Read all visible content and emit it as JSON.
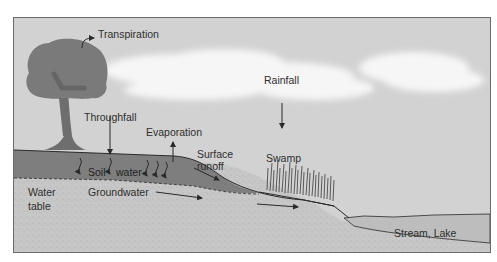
{
  "diagram": {
    "labels": {
      "transpiration": "Transpiration",
      "rainfall": "Rainfall",
      "throughfall": "Throughfall",
      "evaporation": "Evaporation",
      "surface_runoff_1": "Surface",
      "surface_runoff_2": "runoff",
      "swamp": "Swamp",
      "soil": "Soil",
      "water": "water",
      "water_table_1": "Water",
      "water_table_2": "table",
      "groundwater": "Groundwater",
      "stream_lake": "Stream, Lake"
    },
    "colors": {
      "sky": "#d2d2d2",
      "cloud": "#f4f4f4",
      "tree": "#7a7a7a",
      "soil": "#7e7e7e",
      "ground": "#c6c6c6",
      "water": "#bdbdbd",
      "line": "#2a2a2a",
      "border": "#6a6a6a"
    }
  }
}
